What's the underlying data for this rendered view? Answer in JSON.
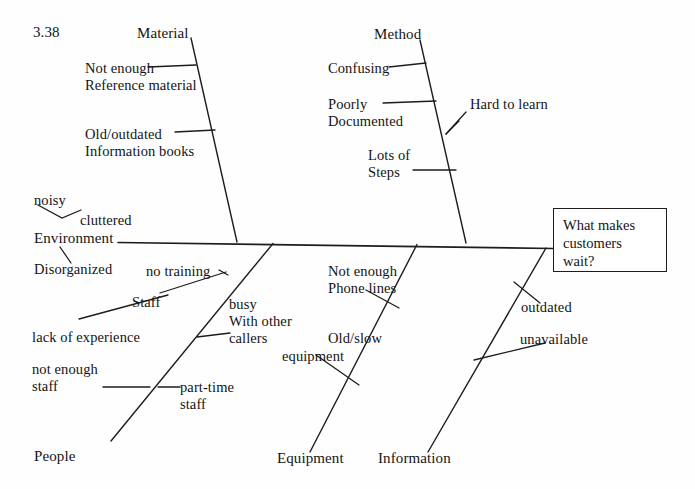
{
  "diagram": {
    "type": "fishbone-ishikawa",
    "figure_label": "3.38",
    "effect": {
      "text": "What makes\ncustomers\nwait?",
      "box_border_color": "#1d1d1d"
    },
    "line_color": "#1d1d1d",
    "background_color": "#fefefe",
    "categories": [
      {
        "id": "material",
        "label": "Material",
        "position": "top",
        "causes": [
          "Not enough\nReference material",
          "Old/outdated\nInformation books"
        ]
      },
      {
        "id": "method",
        "label": "Method",
        "position": "top",
        "causes": [
          "Confusing",
          "Poorly\nDocumented",
          "Hard to learn",
          "Lots of\nSteps"
        ]
      },
      {
        "id": "environment",
        "label": "Environment",
        "position": "spine-start",
        "causes": [
          "noisy",
          "cluttered",
          "Disorganized"
        ]
      },
      {
        "id": "people",
        "label": "People",
        "position": "bottom",
        "causes": [
          "no training",
          "Staff",
          "lack of experience",
          "busy\nWith other\ncallers",
          "not enough\nstaff",
          "part-time\nstaff"
        ]
      },
      {
        "id": "equipment",
        "label": "Equipment",
        "position": "bottom",
        "causes": [
          "Not enough\nPhone lines",
          "Old/slow\nequipment"
        ]
      },
      {
        "id": "information",
        "label": "Information",
        "position": "bottom",
        "causes": [
          "outdated",
          "unavailable"
        ]
      }
    ]
  },
  "labels": {
    "figure_id": "3.38",
    "material": "Material",
    "material_cause_1_line1": "Not enough",
    "material_cause_1_line2": "Reference material",
    "material_cause_2_line1": "Old/outdated",
    "material_cause_2_line2": "Information books",
    "method": "Method",
    "method_cause_confusing": "Confusing",
    "method_cause_poorly_line1": "Poorly",
    "method_cause_poorly_line2": "Documented",
    "method_cause_hard": "Hard to learn",
    "method_cause_lots_line1": "Lots of",
    "method_cause_lots_line2": "Steps",
    "env_noisy": "noisy",
    "env_cluttered": "cluttered",
    "environment": "Environment",
    "env_disorganized": "Disorganized",
    "people_no_training": "no training",
    "people_staff": "Staff",
    "people_lack_exp": "lack of experience",
    "people_busy_line1": "busy",
    "people_busy_line2": "With other",
    "people_busy_line3": "callers",
    "people_not_enough_line1": "not enough",
    "people_not_enough_line2": "staff",
    "people_part_time_line1": "part-time",
    "people_part_time_line2": "staff",
    "people": "People",
    "equip_phone_line1": "Not enough",
    "equip_phone_line2": "Phone lines",
    "equip_old_line1": "Old/slow",
    "equip_old_line2": "equipment",
    "equipment": "Equipment",
    "info_outdated": "outdated",
    "info_unavailable": "unavailable",
    "information": "Information",
    "effect_line1": "What makes",
    "effect_line2": "customers",
    "effect_line3": "wait?"
  }
}
